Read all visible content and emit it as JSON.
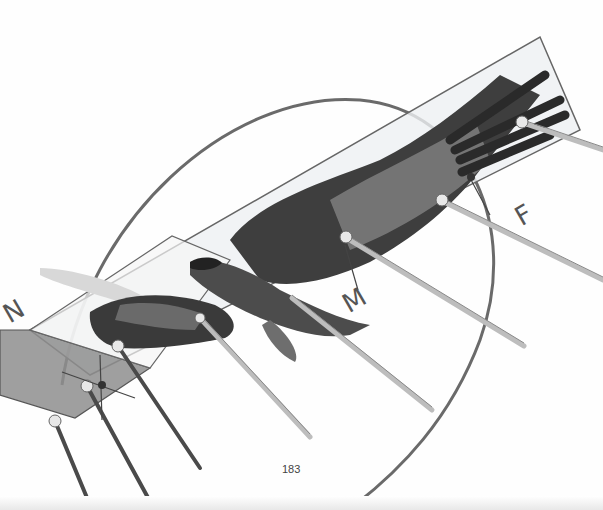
{
  "page": {
    "page_number": "183",
    "labels": {
      "n": "N",
      "m": "M",
      "f": "F"
    },
    "illustration": {
      "subject": "bird-in-flight-force-diagram",
      "colors": {
        "plane_light": "#f2f3f4",
        "plane_dark": "#8e8e8e",
        "arc": "#666666",
        "rod_light": "#cfcfcf",
        "rod_dark": "#4a4a4a",
        "bird_dark": "#2b2b2b",
        "bird_mid": "#7a7a7a"
      }
    }
  }
}
